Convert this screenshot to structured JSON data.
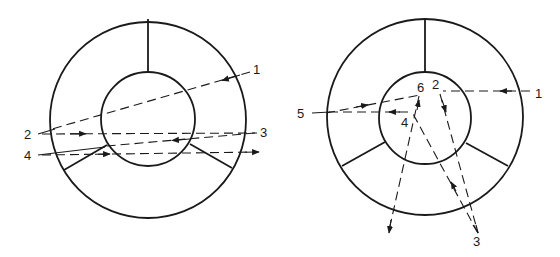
{
  "diagrams": [
    {
      "id": "left",
      "labels": [
        "1",
        "2",
        "3",
        "4"
      ],
      "label_positions": {
        "1": [
          253,
          72
        ],
        "2": [
          24,
          139
        ],
        "3": [
          260,
          136
        ],
        "4": [
          24,
          160
        ]
      },
      "description": "Cross-section of two concentric circles with three radial spokes; dashed ray paths 1-4 crossing with arrowheads"
    },
    {
      "id": "right",
      "labels": [
        "1",
        "2",
        "3",
        "4",
        "5",
        "6"
      ],
      "label_positions": {
        "1": [
          535,
          98
        ],
        "2": [
          432,
          89
        ],
        "3": [
          476,
          243
        ],
        "4": [
          401,
          126
        ],
        "5": [
          297,
          117
        ],
        "6": [
          418,
          92
        ]
      },
      "description": "Cross-section of two concentric circles with three radial spokes; dashed ray paths 1-6 with reflections inside inner circle"
    }
  ],
  "colors": {
    "stroke": "#1a1a1a",
    "background": "#ffffff"
  }
}
